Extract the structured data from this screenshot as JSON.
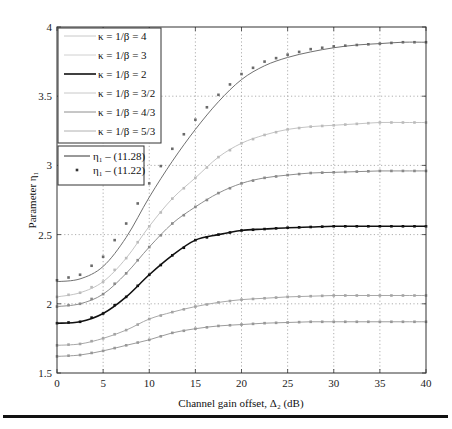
{
  "chart_data": {
    "type": "line",
    "title": "",
    "xlabel": "Channel gain offset, Δ₂ (dB)",
    "ylabel": "Parameter η₁",
    "xlim": [
      0,
      40
    ],
    "ylim": [
      1.5,
      4
    ],
    "xticks": [
      0,
      5,
      10,
      15,
      20,
      25,
      30,
      35,
      40
    ],
    "yticks": [
      1.5,
      2,
      2.5,
      3,
      3.5,
      4
    ],
    "xtick_labels": [
      "0",
      "5",
      "10",
      "15",
      "20",
      "25",
      "30",
      "35",
      "40"
    ],
    "ytick_labels": [
      "1.5",
      "2",
      "2.5",
      "3",
      "3.5",
      "4"
    ],
    "grid": true,
    "legend_position": "upper left",
    "x": [
      0,
      2.5,
      5,
      7.5,
      10,
      12.5,
      15,
      17.5,
      20,
      22.5,
      25,
      27.5,
      30,
      32.5,
      35,
      37.5,
      40
    ],
    "series": [
      {
        "name": "κ = 1/β = 4",
        "color": "#707070",
        "width": 1.0,
        "values": [
          2.16,
          2.18,
          2.27,
          2.48,
          2.77,
          3.03,
          3.26,
          3.46,
          3.62,
          3.72,
          3.78,
          3.82,
          3.85,
          3.87,
          3.88,
          3.89,
          3.89
        ]
      },
      {
        "name": "κ = 1/β = 3",
        "color": "#c4c4c4",
        "width": 1.0,
        "values": [
          2.05,
          2.08,
          2.16,
          2.33,
          2.56,
          2.76,
          2.91,
          3.06,
          3.16,
          3.22,
          3.26,
          3.28,
          3.29,
          3.3,
          3.31,
          3.31,
          3.31
        ]
      },
      {
        "name": "κ = 1/β = 2",
        "color": "#111111",
        "width": 1.6,
        "values": [
          1.86,
          1.87,
          1.93,
          2.05,
          2.21,
          2.35,
          2.46,
          2.5,
          2.53,
          2.54,
          2.55,
          2.555,
          2.56,
          2.56,
          2.56,
          2.56,
          2.56
        ]
      },
      {
        "name": "κ = 1/β = 3/2",
        "color": "#8e8e8e",
        "width": 1.0,
        "values": [
          1.98,
          2.0,
          2.07,
          2.22,
          2.41,
          2.58,
          2.7,
          2.8,
          2.87,
          2.91,
          2.93,
          2.945,
          2.95,
          2.955,
          2.96,
          2.96,
          2.96
        ]
      },
      {
        "name": "κ = 1/β = 4/3",
        "color": "#a8a8a8",
        "width": 1.0,
        "values": [
          1.7,
          1.71,
          1.75,
          1.81,
          1.89,
          1.94,
          1.98,
          2.01,
          2.03,
          2.04,
          2.05,
          2.055,
          2.06,
          2.06,
          2.06,
          2.06,
          2.06
        ]
      },
      {
        "name": "κ = 1/β = 5/3",
        "color": "#9c9c9c",
        "width": 1.0,
        "values": [
          1.62,
          1.63,
          1.66,
          1.7,
          1.74,
          1.79,
          1.82,
          1.84,
          1.85,
          1.86,
          1.865,
          1.87,
          1.87,
          1.87,
          1.87,
          1.87,
          1.87
        ]
      }
    ],
    "marker_series": [
      {
        "name": "κ = 1/β = 4 (11.22)",
        "color": "#6a6a6a",
        "values": [
          2.17,
          2.21,
          2.34,
          2.58,
          2.87,
          3.12,
          3.33,
          3.51,
          3.66,
          3.75,
          3.8,
          3.84,
          3.86,
          3.87,
          3.88,
          3.89,
          3.89
        ]
      },
      {
        "name": "κ = 1/β = 3 (11.22)",
        "color": "#bbbbbb",
        "values": [
          2.05,
          2.08,
          2.16,
          2.33,
          2.56,
          2.76,
          2.91,
          3.06,
          3.16,
          3.22,
          3.26,
          3.28,
          3.29,
          3.3,
          3.31,
          3.31,
          3.31
        ]
      },
      {
        "name": "κ = 1/β = 2 (11.22)",
        "color": "#111111",
        "values": [
          1.86,
          1.87,
          1.93,
          2.05,
          2.21,
          2.35,
          2.46,
          2.5,
          2.53,
          2.54,
          2.55,
          2.555,
          2.56,
          2.56,
          2.56,
          2.56,
          2.56
        ]
      },
      {
        "name": "κ = 1/β = 3/2 (11.22)",
        "color": "#8a8a8a",
        "values": [
          1.98,
          2.0,
          2.07,
          2.22,
          2.41,
          2.58,
          2.7,
          2.8,
          2.87,
          2.91,
          2.93,
          2.945,
          2.95,
          2.955,
          2.96,
          2.96,
          2.96
        ]
      },
      {
        "name": "κ = 1/β = 4/3 (11.22)",
        "color": "#a4a4a4",
        "values": [
          1.7,
          1.71,
          1.75,
          1.81,
          1.89,
          1.94,
          1.98,
          2.01,
          2.03,
          2.04,
          2.05,
          2.055,
          2.06,
          2.06,
          2.06,
          2.06,
          2.06
        ]
      },
      {
        "name": "κ = 1/β = 5/3 (11.22)",
        "color": "#989898",
        "values": [
          1.62,
          1.63,
          1.66,
          1.7,
          1.74,
          1.79,
          1.82,
          1.84,
          1.85,
          1.86,
          1.865,
          1.87,
          1.87,
          1.87,
          1.87,
          1.87,
          1.87
        ]
      }
    ],
    "legends": [
      {
        "entries": [
          {
            "label": "κ = 1/β = 4",
            "color": "#c8c8c8",
            "style": "line"
          },
          {
            "label": "κ = 1/β = 3",
            "color": "#d0d0d0",
            "style": "line"
          },
          {
            "label": "κ = 1/β = 2",
            "color": "#111111",
            "style": "line"
          },
          {
            "label": "κ = 1/β = 3/2",
            "color": "#c8c8c8",
            "style": "line"
          },
          {
            "label": "κ = 1/β = 4/3",
            "color": "#8e8e8e",
            "style": "line"
          },
          {
            "label": "κ = 1/β = 5/3",
            "color": "#b0b0b0",
            "style": "line"
          }
        ]
      },
      {
        "entries": [
          {
            "label": "η₁ – (11.28)",
            "color": "#333333",
            "style": "line"
          },
          {
            "label": "η₁ – (11.22)",
            "color": "#333333",
            "style": "marker"
          }
        ]
      }
    ]
  }
}
